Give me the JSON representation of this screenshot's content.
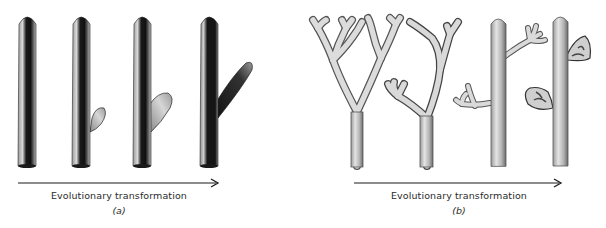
{
  "figure": {
    "panels": [
      {
        "id": "a",
        "label": "(a)",
        "caption": "Evolutionary transformation",
        "stages": [
          {
            "description": "Unbranched stem"
          },
          {
            "description": "Stem with small lateral bud"
          },
          {
            "description": "Stem with larger lateral outgrowth"
          },
          {
            "description": "Stem with elongated side branch"
          }
        ]
      },
      {
        "id": "b",
        "label": "(b)",
        "caption": "Evolutionary transformation",
        "stages": [
          {
            "description": "Equal dichotomous branching"
          },
          {
            "description": "Unequal (overtopping) branching"
          },
          {
            "description": "Main axis with lateral branch systems"
          },
          {
            "description": "Main axis with webbed (laminate) lateral systems"
          }
        ]
      }
    ],
    "colors": {
      "ink": "#1a1a1a",
      "text": "#2a2a2a",
      "background": "#ffffff"
    }
  }
}
